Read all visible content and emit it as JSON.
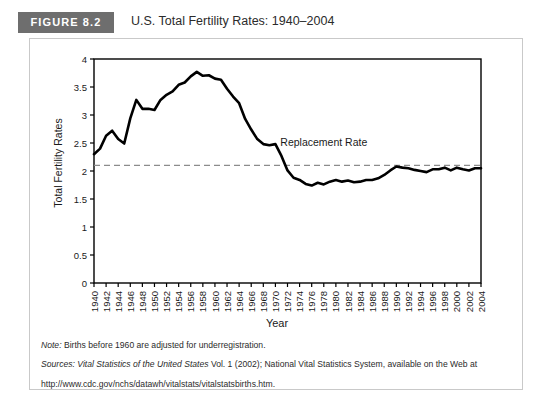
{
  "figure": {
    "badge": "FIGURE 8.2",
    "title": "U.S. Total Fertility Rates: 1940–2004"
  },
  "notes": {
    "note_label": "Note:",
    "note_text": " Births before 1960 are adjusted for underregistration.",
    "sources_label": "Sources:",
    "sources_italic": " Vital Statistics of the United States",
    "sources_rest": " Vol. 1 (2002); National Vital Statistics System, available on the Web at",
    "url": "http://www.cdc.gov/nchs/datawh/vitalstats/vitalstatsbirths.htm."
  },
  "colors": {
    "line": "#000000",
    "badge_bg": "#6e6e6e",
    "card_border": "#c9c9c9",
    "axis": "#000000",
    "replacement_line": "#8c8c8c"
  },
  "chart_data": {
    "type": "line",
    "title": "U.S. Total Fertility Rates: 1940–2004",
    "xlabel": "Year",
    "ylabel": "Total Fertility Rates",
    "xlim": [
      1940,
      2004
    ],
    "ylim": [
      0,
      4
    ],
    "yticks": [
      0,
      0.5,
      1,
      1.5,
      2,
      2.5,
      3,
      3.5,
      4
    ],
    "ytick_labels": [
      "0",
      "0.5",
      "1",
      "1.5",
      "2",
      "2.5",
      "3",
      "3.5",
      "4"
    ],
    "xticks": [
      1940,
      1942,
      1944,
      1946,
      1948,
      1950,
      1952,
      1954,
      1956,
      1958,
      1960,
      1962,
      1964,
      1966,
      1968,
      1970,
      1972,
      1974,
      1976,
      1978,
      1980,
      1982,
      1984,
      1986,
      1988,
      1990,
      1992,
      1994,
      1996,
      1998,
      2000,
      2002,
      2004
    ],
    "grid": false,
    "legend": false,
    "annotations": [
      {
        "text": "Replacement Rate",
        "x": 1978,
        "y": 2.45
      }
    ],
    "reference_lines": [
      {
        "label": "Replacement Rate",
        "y": 2.1,
        "style": "dashed"
      }
    ],
    "series": [
      {
        "name": "Total Fertility Rate",
        "x": [
          1940,
          1941,
          1942,
          1943,
          1944,
          1945,
          1946,
          1947,
          1948,
          1949,
          1950,
          1951,
          1952,
          1953,
          1954,
          1955,
          1956,
          1957,
          1958,
          1959,
          1960,
          1961,
          1962,
          1963,
          1964,
          1965,
          1966,
          1967,
          1968,
          1969,
          1970,
          1971,
          1972,
          1973,
          1974,
          1975,
          1976,
          1977,
          1978,
          1979,
          1980,
          1981,
          1982,
          1983,
          1984,
          1985,
          1986,
          1987,
          1988,
          1989,
          1990,
          1991,
          1992,
          1993,
          1994,
          1995,
          1996,
          1997,
          1998,
          1999,
          2000,
          2001,
          2002,
          2003,
          2004
        ],
        "values": [
          2.3,
          2.4,
          2.63,
          2.72,
          2.57,
          2.49,
          2.94,
          3.27,
          3.11,
          3.11,
          3.09,
          3.27,
          3.36,
          3.42,
          3.54,
          3.58,
          3.69,
          3.77,
          3.7,
          3.71,
          3.65,
          3.63,
          3.47,
          3.33,
          3.21,
          2.93,
          2.74,
          2.57,
          2.48,
          2.46,
          2.48,
          2.27,
          2.01,
          1.88,
          1.84,
          1.77,
          1.74,
          1.79,
          1.76,
          1.81,
          1.84,
          1.81,
          1.83,
          1.8,
          1.81,
          1.84,
          1.84,
          1.87,
          1.93,
          2.01,
          2.08,
          2.06,
          2.05,
          2.02,
          2.0,
          1.98,
          2.03,
          2.03,
          2.06,
          2.01,
          2.06,
          2.03,
          2.01,
          2.05,
          2.05
        ]
      }
    ]
  }
}
